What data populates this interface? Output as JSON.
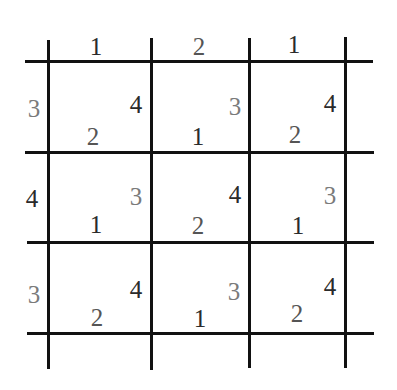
{
  "puzzle": {
    "rows": 3,
    "cols": 3,
    "top_labels": [
      {
        "value": "1",
        "tone": "dark"
      },
      {
        "value": "2",
        "tone": "mid"
      },
      {
        "value": "1",
        "tone": "dark"
      }
    ],
    "left_labels": [
      {
        "value": "3",
        "tone": "light"
      },
      {
        "value": "4",
        "tone": "dark"
      },
      {
        "value": "3",
        "tone": "light"
      }
    ],
    "cells": [
      [
        {
          "right": "4",
          "right_tone": "dark",
          "bottom": "2",
          "bottom_tone": "mid"
        },
        {
          "right": "3",
          "right_tone": "light",
          "bottom": "1",
          "bottom_tone": "dark"
        },
        {
          "right": "4",
          "right_tone": "dark",
          "bottom": "2",
          "bottom_tone": "mid"
        }
      ],
      [
        {
          "right": "3",
          "right_tone": "light",
          "bottom": "1",
          "bottom_tone": "dark"
        },
        {
          "right": "4",
          "right_tone": "dark",
          "bottom": "2",
          "bottom_tone": "mid"
        },
        {
          "right": "3",
          "right_tone": "light",
          "bottom": "1",
          "bottom_tone": "dark"
        }
      ],
      [
        {
          "right": "4",
          "right_tone": "dark",
          "bottom": "2",
          "bottom_tone": "mid"
        },
        {
          "right": "3",
          "right_tone": "light",
          "bottom": "1",
          "bottom_tone": "dark"
        },
        {
          "right": "4",
          "right_tone": "dark",
          "bottom": "2",
          "bottom_tone": "mid"
        }
      ]
    ]
  }
}
